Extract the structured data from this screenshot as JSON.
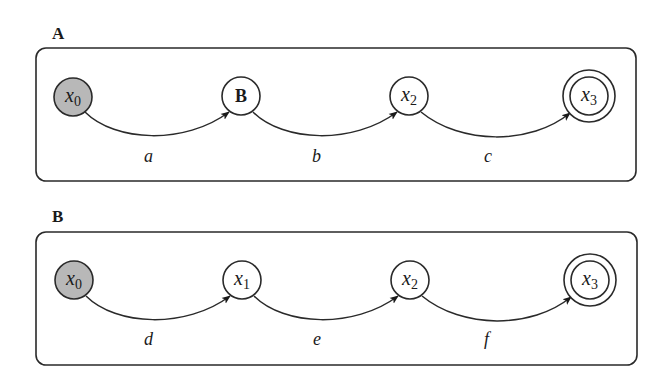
{
  "diagram": {
    "type": "state-machine-comparison",
    "colors": {
      "stroke": "#2a2a2a",
      "start_fill": "#b8b8b8",
      "node_fill": "#ffffff",
      "background": "#ffffff"
    },
    "panels": [
      {
        "label": "A",
        "nodes": [
          {
            "id": "x0",
            "main": "x",
            "sub": "0",
            "kind": "start"
          },
          {
            "id": "B",
            "main": "B",
            "sub": "",
            "kind": "macro"
          },
          {
            "id": "x2",
            "main": "x",
            "sub": "2",
            "kind": "normal"
          },
          {
            "id": "x3",
            "main": "x",
            "sub": "3",
            "kind": "accepting"
          }
        ],
        "edges": [
          {
            "from": "x0",
            "to": "B",
            "label": "a"
          },
          {
            "from": "B",
            "to": "x2",
            "label": "b"
          },
          {
            "from": "x2",
            "to": "x3",
            "label": "c"
          }
        ]
      },
      {
        "label": "B",
        "nodes": [
          {
            "id": "x0",
            "main": "x",
            "sub": "0",
            "kind": "start"
          },
          {
            "id": "x1",
            "main": "x",
            "sub": "1",
            "kind": "normal"
          },
          {
            "id": "x2",
            "main": "x",
            "sub": "2",
            "kind": "normal"
          },
          {
            "id": "x3",
            "main": "x",
            "sub": "3",
            "kind": "accepting"
          }
        ],
        "edges": [
          {
            "from": "x0",
            "to": "x1",
            "label": "d"
          },
          {
            "from": "x1",
            "to": "x2",
            "label": "e"
          },
          {
            "from": "x2",
            "to": "x3",
            "label": "f"
          }
        ]
      }
    ]
  }
}
